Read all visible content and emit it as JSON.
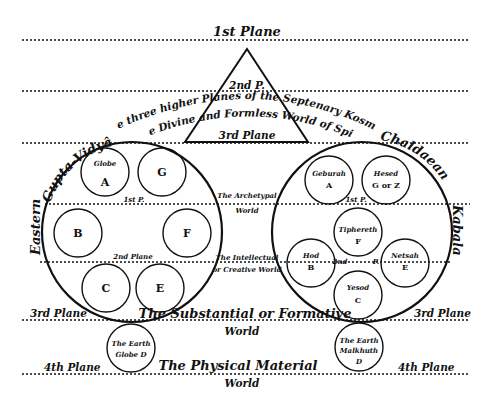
{
  "planes": {
    "first": "1st Plane",
    "second_short": "2nd P.",
    "third_in_triangle": "3rd Plane",
    "third_left": "3rd Plane",
    "third_right": "3rd Plane",
    "fourth_left": "4th Plane",
    "fourth_right": "4th Plane"
  },
  "arched_text": {
    "line1": "The three higher Planes of the Septenary Kosmos",
    "line2": "The Divine and Formless World of Spirit"
  },
  "worlds": {
    "archetypal_line1": "The Archetypal",
    "archetypal_line2": "World",
    "intellectual_line1": "The Intellectual",
    "intellectual_line2": "or Creative World",
    "substantial_line1": "The Substantial or Formative",
    "substantial_line2": "World",
    "physical_line1": "The Physical Material",
    "physical_line2": "World"
  },
  "left_system": {
    "title_part1": "Eastern",
    "title_part2": "Gupta-Vidyâ",
    "inner_label_1st": "1st P.",
    "inner_label_2nd": "2nd Plane",
    "globes": [
      {
        "name": "Globe",
        "letter": "A"
      },
      {
        "name": "",
        "letter": "G"
      },
      {
        "name": "",
        "letter": "B"
      },
      {
        "name": "",
        "letter": "F"
      },
      {
        "name": "",
        "letter": "C"
      },
      {
        "name": "",
        "letter": "E"
      }
    ],
    "earth": {
      "line1": "The Earth",
      "line2": "Globe D"
    }
  },
  "right_system": {
    "title_part1": "Chaldaean",
    "title_part2": "Kabala",
    "inner_label_1st": "1st P.",
    "inner_label_2nd_a": "2nd",
    "inner_label_2nd_b": "P.",
    "sephiroth": [
      {
        "name": "Geburah",
        "letter": "A"
      },
      {
        "name": "Hesed",
        "letter": "G or Z"
      },
      {
        "name": "Tiphereth",
        "letter": "F"
      },
      {
        "name": "Hod",
        "letter": "B"
      },
      {
        "name": "Netsah",
        "letter": "E"
      },
      {
        "name": "Yesod",
        "letter": "C"
      }
    ],
    "earth": {
      "line1": "The Earth",
      "line2": "Malkhuth",
      "line3": "D"
    }
  }
}
